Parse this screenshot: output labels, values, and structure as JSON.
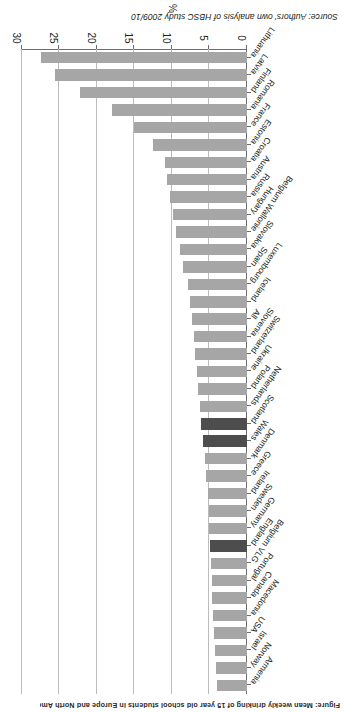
{
  "figure": {
    "title": "Figure: Mean weekly drinking of 15 year old school students in Europe and North America",
    "source": "Source: Authors' own analysis of HBSC study 2009/10"
  },
  "chart_data": {
    "type": "bar",
    "orientation": "horizontal",
    "title": "",
    "xlabel": "%",
    "ylabel": "",
    "xlim": [
      0,
      30
    ],
    "xticks": [
      0,
      5,
      10,
      15,
      20,
      25,
      30
    ],
    "xticklabels": [
      "0",
      "5",
      "10",
      "15",
      "20",
      "25",
      "30"
    ],
    "grid": true,
    "legend": null,
    "highlight_color": "#4d4d4d",
    "bar_color": "#a6a6a6",
    "highlight_categories": [
      "England",
      "Wales",
      "Scotland"
    ],
    "categories": [
      "Lithuania",
      "Latvia",
      "Finland",
      "Romania",
      "France",
      "Estonia",
      "Croatia",
      "Austria",
      "Russia",
      "Hungary",
      "Belgium Wallonie",
      "Slovakia",
      "Spain",
      "Luxembourg",
      "Iceland",
      "All",
      "Slovenia",
      "Switzerland",
      "Ukraine",
      "Poland",
      "Netherlands",
      "Scotland",
      "Wales",
      "Denmark",
      "Greece",
      "Ireland",
      "Sweden",
      "Germany",
      "England",
      "Belgium VLG",
      "Portugal",
      "Canada",
      "Macedonia",
      "USA",
      "Israel",
      "Norway",
      "Armenia"
    ],
    "values": [
      27.5,
      25.6,
      22.3,
      18.0,
      15.1,
      12.5,
      10.9,
      10.7,
      10.2,
      9.8,
      9.5,
      8.9,
      8.5,
      7.8,
      7.6,
      7.3,
      7.1,
      6.9,
      6.7,
      6.5,
      6.2,
      6.1,
      5.9,
      5.6,
      5.4,
      5.2,
      5.1,
      5.0,
      4.9,
      4.8,
      4.7,
      4.6,
      4.5,
      4.4,
      4.2,
      4.1,
      4.0
    ]
  }
}
